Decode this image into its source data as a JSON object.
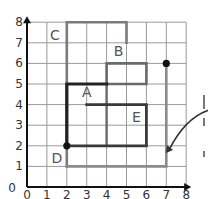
{
  "grid": {
    "x_min": 0,
    "x_max": 8,
    "y_min": 0,
    "y_max": 8,
    "origin_px": [
      27,
      187
    ],
    "unit_px": [
      19.9,
      20.6
    ],
    "grid_color": "#9a9a9a",
    "axis_color": "#111111"
  },
  "axes": {
    "x_ticks": [
      "0",
      "1",
      "2",
      "3",
      "4",
      "5",
      "6",
      "7",
      "8"
    ],
    "y_ticks": [
      "0",
      "1",
      "2",
      "3",
      "4",
      "5",
      "6",
      "7",
      "8"
    ],
    "origin_label": "0"
  },
  "labels": [
    {
      "text": "C",
      "x": 1.4,
      "y": 7.4
    },
    {
      "text": "A",
      "x": 3.0,
      "y": 4.6
    },
    {
      "text": "B",
      "x": 4.6,
      "y": 6.6
    },
    {
      "text": "E",
      "x": 5.5,
      "y": 3.4
    },
    {
      "text": "D",
      "x": 1.5,
      "y": 1.4
    }
  ],
  "paths": [
    {
      "name": "grey-route-c",
      "color": "#7a7a7a",
      "width": 2.6,
      "points": [
        [
          2,
          1
        ],
        [
          2,
          8
        ],
        [
          5,
          8
        ],
        [
          5,
          7
        ]
      ]
    },
    {
      "name": "grey-route-d",
      "color": "#8a8a8a",
      "width": 2.6,
      "points": [
        [
          2,
          1
        ],
        [
          7,
          1
        ],
        [
          7,
          6
        ]
      ]
    },
    {
      "name": "b-rect",
      "color": "#6a6a6a",
      "width": 2.6,
      "points": [
        [
          4,
          5
        ],
        [
          4,
          6
        ],
        [
          6,
          6
        ],
        [
          6,
          5
        ],
        [
          4,
          5
        ]
      ]
    },
    {
      "name": "a-inner-vertical",
      "color": "#6a6a6a",
      "width": 2.4,
      "points": [
        [
          4,
          5
        ],
        [
          4,
          2
        ]
      ]
    },
    {
      "name": "e-rect",
      "color": "#3a3a3a",
      "width": 2.8,
      "points": [
        [
          3,
          4
        ],
        [
          6,
          4
        ],
        [
          6,
          2
        ],
        [
          2,
          2
        ]
      ]
    },
    {
      "name": "dark-route-a",
      "color": "#222222",
      "width": 3.2,
      "points": [
        [
          2,
          2
        ],
        [
          2,
          5
        ],
        [
          4,
          5
        ]
      ]
    }
  ],
  "points": [
    {
      "name": "start-dot",
      "x": 2,
      "y": 2
    },
    {
      "name": "end-dot",
      "x": 7,
      "y": 6
    }
  ],
  "arrow": {
    "from": [
      209,
      110
    ],
    "to": [
      166,
      153
    ],
    "color": "#333333"
  },
  "edge_fragments": [
    {
      "x": 203,
      "y": 95,
      "h": 14
    },
    {
      "x": 203,
      "y": 118,
      "h": 8
    },
    {
      "x": 203,
      "y": 151,
      "h": 6
    }
  ]
}
